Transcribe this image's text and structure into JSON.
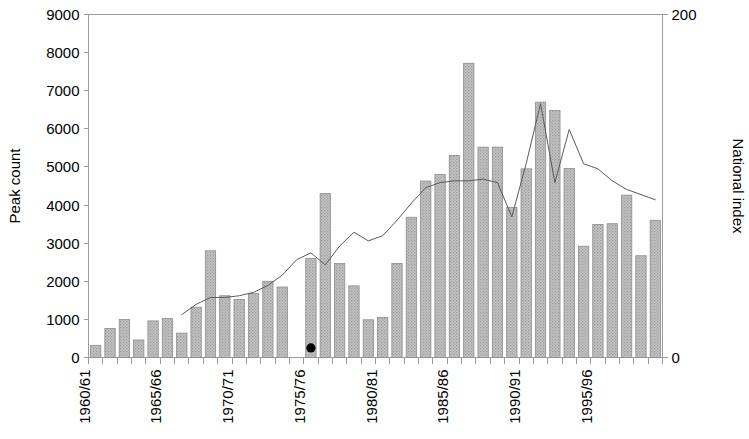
{
  "chart_data": {
    "type": "bar",
    "title": "",
    "subtitle": "",
    "xlabel": "",
    "ylabel": "Peak count",
    "y2label": "National index",
    "ylim": [
      0,
      9000
    ],
    "y2lim": [
      0,
      200
    ],
    "ytick_step": 1000,
    "y2tick_step": 200,
    "grid": false,
    "legend": "none",
    "yticks": [
      "0",
      "1000",
      "2000",
      "3000",
      "4000",
      "5000",
      "6000",
      "7000",
      "8000",
      "9000"
    ],
    "y2ticks": [
      "0",
      "20",
      "40",
      "60",
      "80",
      "100",
      "120",
      "140",
      "160",
      "180",
      "200"
    ],
    "categories": [
      "1960/61",
      "1961/62",
      "1962/63",
      "1963/64",
      "1964/65",
      "1965/66",
      "1966/67",
      "1967/68",
      "1968/69",
      "1969/70",
      "1970/71",
      "1971/72",
      "1972/73",
      "1973/74",
      "1974/75",
      "1975/76",
      "1976/77",
      "1977/78",
      "1978/79",
      "1979/80",
      "1980/81",
      "1981/82",
      "1982/83",
      "1983/84",
      "1984/85",
      "1985/86",
      "1986/87",
      "1987/88",
      "1988/89",
      "1989/90",
      "1990/91",
      "1991/92",
      "1992/93",
      "1993/94",
      "1994/95",
      "1995/96",
      "1996/97",
      "1997/98",
      "1998/99",
      "1999/00"
    ],
    "xtick_labels": [
      "1960/61",
      "1965/66",
      "1970/71",
      "1975/76",
      "1980/81",
      "1985/86",
      "1990/91",
      "1995/96"
    ],
    "xtick_label_indices": [
      0,
      5,
      10,
      15,
      20,
      25,
      30,
      35
    ],
    "series": [
      {
        "name": "Peak count",
        "type": "bar",
        "axis": "left",
        "color": "#b3b3b3",
        "values": [
          320,
          760,
          1000,
          460,
          960,
          1020,
          640,
          1320,
          2800,
          1620,
          1520,
          1680,
          2000,
          1850,
          null,
          2600,
          4300,
          2470,
          1880,
          990,
          1050,
          2470,
          3680,
          4630,
          4800,
          5300,
          7720,
          5520,
          5520,
          3940,
          4950,
          6700,
          6480,
          4960,
          2920,
          3490,
          3510,
          4260,
          2670,
          3600
        ]
      },
      {
        "name": "National index",
        "type": "line",
        "axis": "right",
        "color": "#5a5a5a",
        "start_index": 6,
        "values": [
          null,
          null,
          null,
          null,
          null,
          null,
          25,
          31,
          35,
          35,
          36,
          38,
          42,
          48,
          57,
          61,
          54,
          65,
          73,
          68,
          71,
          80,
          90,
          99,
          102,
          103,
          103,
          104,
          102,
          82,
          113,
          148,
          102,
          133,
          113,
          110,
          103,
          98,
          95,
          92
        ]
      }
    ],
    "annotations": [
      {
        "name": "missing-data-dot",
        "category": "1975/76",
        "x_index": 15,
        "y_left": 250,
        "shape": "filled-circle"
      }
    ]
  }
}
